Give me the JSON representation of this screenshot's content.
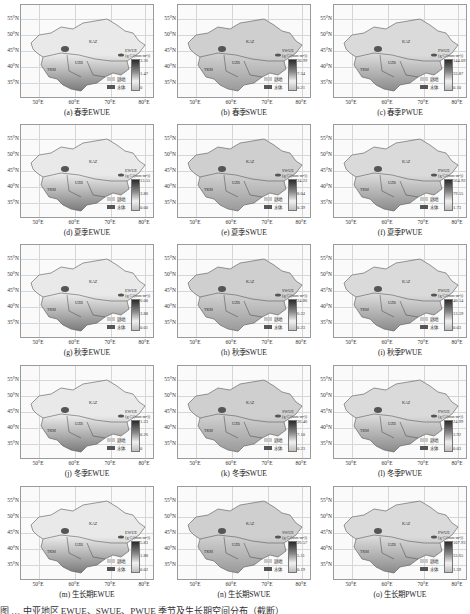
{
  "figure": {
    "caption_partial": "图 … 中亚地区 EWUE、SWUE、PWUE 季节及生长期空间分布（截断）"
  },
  "axes": {
    "lat_ticks": [
      "55°N",
      "50°N",
      "45°N",
      "40°N",
      "35°N"
    ],
    "lon_ticks": [
      "50°E",
      "60°E",
      "70°E",
      "80°E"
    ]
  },
  "legend": {
    "cropland_label": "耕地",
    "water_label": "水体",
    "cropland_color": "#c8c8c8",
    "water_color": "#555555"
  },
  "region_labels": {
    "kaz": "KAZ",
    "uzb": "UZB",
    "tkm": "TKM",
    "kgz": "KGZ"
  },
  "unit": "(g C/(mm·m²))",
  "chart_data": [
    {
      "id": "a",
      "type": "heatmap",
      "title": "(a) 春季EWUE",
      "season": "春季",
      "variable": "EWUE",
      "colorbar": {
        "max": "3.36",
        "mid": "1.47",
        "min": "0"
      }
    },
    {
      "id": "b",
      "type": "heatmap",
      "title": "(b) 春季SWUE",
      "season": "春季",
      "variable": "SWUE",
      "colorbar": {
        "max": "20.99",
        "mid": "7.34",
        "min": "0.21"
      }
    },
    {
      "id": "c",
      "type": "heatmap",
      "title": "(c) 春季PWUE",
      "season": "春季",
      "variable": "PWUE",
      "colorbar": {
        "max": "144.09",
        "mid": "33.87",
        "min": "0.10"
      }
    },
    {
      "id": "d",
      "type": "heatmap",
      "title": "(d) 夏季EWUE",
      "season": "夏季",
      "variable": "EWUE",
      "colorbar": {
        "max": "13.55",
        "mid": "3.86",
        "min": "0.00"
      }
    },
    {
      "id": "e",
      "type": "heatmap",
      "title": "(e) 夏季SWUE",
      "season": "夏季",
      "variable": "SWUE",
      "colorbar": {
        "max": "34.22",
        "mid": "8.04",
        "min": "0.39"
      }
    },
    {
      "id": "f",
      "type": "heatmap",
      "title": "(f) 夏季PWUE",
      "season": "夏季",
      "variable": "PWUE",
      "colorbar": {
        "max": "564.92",
        "mid": "79.55",
        "min": "1.73"
      }
    },
    {
      "id": "g",
      "type": "heatmap",
      "title": "(g) 秋季EWUE",
      "season": "秋季",
      "variable": "EWUE",
      "colorbar": {
        "max": "6.00",
        "mid": "3.88",
        "min": "0.01"
      }
    },
    {
      "id": "h",
      "type": "heatmap",
      "title": "(h) 秋季SWUE",
      "season": "秋季",
      "variable": "SWUE",
      "colorbar": {
        "max": "24.86",
        "mid": "6.22",
        "min": "0.23"
      }
    },
    {
      "id": "i",
      "type": "heatmap",
      "title": "(i) 秋季PWUE",
      "season": "秋季",
      "variable": "PWUE",
      "colorbar": {
        "max": "40.54",
        "mid": "13.59",
        "min": "0.03"
      }
    },
    {
      "id": "j",
      "type": "heatmap",
      "title": "(j) 冬季EWUE",
      "season": "冬季",
      "variable": "EWUE",
      "colorbar": {
        "max": "1.23",
        "mid": "0.26",
        "min": "0"
      }
    },
    {
      "id": "k",
      "type": "heatmap",
      "title": "(k) 冬季SWUE",
      "season": "冬季",
      "variable": "SWUE",
      "colorbar": {
        "max": "36.46",
        "mid": "7.10",
        "min": "0.23"
      }
    },
    {
      "id": "l",
      "type": "heatmap",
      "title": "(l) 冬季PWUE",
      "season": "冬季",
      "variable": "PWUE",
      "colorbar": {
        "max": "24.99",
        "mid": "3.92",
        "min": "0.03"
      }
    },
    {
      "id": "m",
      "type": "heatmap",
      "title": "(m) 生长期EWUE",
      "season": "生长期",
      "variable": "EWUE",
      "colorbar": {
        "max": "5.83",
        "mid": "1.88",
        "min": "0.02"
      }
    },
    {
      "id": "n",
      "type": "heatmap",
      "title": "(n) 生长期SWUE",
      "season": "生长期",
      "variable": "SWUE",
      "colorbar": {
        "max": "26.57",
        "mid": "5.11",
        "min": "0.19"
      }
    },
    {
      "id": "o",
      "type": "heatmap",
      "title": "(o) 生长期PWUE",
      "season": "生长期",
      "variable": "PWUE",
      "colorbar": {
        "max": "107.93",
        "mid": "33.65",
        "min": "1.59"
      }
    }
  ]
}
